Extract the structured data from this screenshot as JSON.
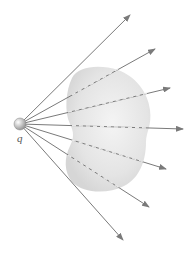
{
  "diagram": {
    "charge": {
      "label": "q",
      "cx": 20,
      "cy": 124,
      "r": 6
    },
    "surface": {
      "description": "closed surface (shaded blob) not enclosing charge",
      "fill": "#e6e6e6"
    },
    "ray_color": "#7a7a7a",
    "rays": [
      {
        "x2": 130,
        "y2": 15,
        "dashed_inside_surface": false
      },
      {
        "x2": 155,
        "y2": 49,
        "dashed_inside_surface": true
      },
      {
        "x2": 170,
        "y2": 88,
        "dashed_inside_surface": true
      },
      {
        "x2": 183,
        "y2": 129,
        "dashed_inside_surface": true
      },
      {
        "x2": 166,
        "y2": 169,
        "dashed_inside_surface": true
      },
      {
        "x2": 149,
        "y2": 207,
        "dashed_inside_surface": true
      },
      {
        "x2": 123,
        "y2": 240,
        "dashed_inside_surface": false
      }
    ]
  }
}
